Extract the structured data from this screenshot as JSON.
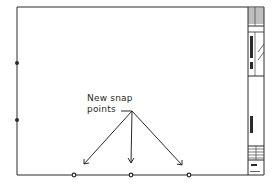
{
  "diagram": {
    "annotation": {
      "line1": "New snap",
      "line2": "points"
    },
    "title_block": {
      "vertical_label_1": "ARCHITECTURAL",
      "vertical_label_2": "LANE",
      "vertical_label_3": "PRELIMINARY",
      "sheet_number": "A-1"
    },
    "snap_points": {
      "left_edge": [
        {
          "x": 17,
          "y": 63
        },
        {
          "x": 17,
          "y": 120
        }
      ],
      "bottom_edge": [
        {
          "x": 74,
          "y": 175
        },
        {
          "x": 131,
          "y": 175
        },
        {
          "x": 189,
          "y": 175
        }
      ]
    },
    "colors": {
      "line": "#2a2a2a",
      "background": "#ffffff"
    }
  }
}
